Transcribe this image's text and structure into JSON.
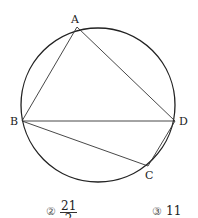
{
  "figure": {
    "type": "circle-inscribed-quadrilateral",
    "circle": {
      "cx": 98,
      "cy": 105,
      "r": 77
    },
    "points": {
      "A": {
        "label": "A",
        "x": 77,
        "y": 27
      },
      "B": {
        "label": "B",
        "x": 22,
        "y": 121
      },
      "C": {
        "label": "C",
        "x": 148,
        "y": 166
      },
      "D": {
        "label": "D",
        "x": 175,
        "y": 121
      }
    },
    "segments": [
      "AB",
      "AD",
      "BD",
      "BC",
      "CD"
    ]
  },
  "choices": [
    {
      "marker": "②",
      "numerator": "21",
      "denominator": "2"
    },
    {
      "marker": "③",
      "value": "11"
    }
  ]
}
